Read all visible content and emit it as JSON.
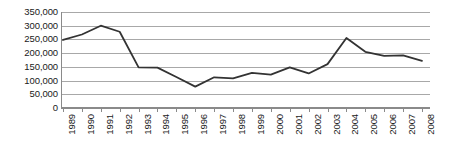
{
  "chart_data": {
    "type": "line",
    "title": "",
    "xlabel": "",
    "ylabel": "",
    "grid": true,
    "legend": false,
    "ylim": [
      0,
      350000
    ],
    "ytick_step": 50000,
    "ytick_labels": [
      "350,000",
      "300,000",
      "250,000",
      "200,000",
      "150,000",
      "100,000",
      "50,000",
      "0"
    ],
    "ytick_values": [
      350000,
      300000,
      250000,
      200000,
      150000,
      100000,
      50000,
      0
    ],
    "categories": [
      "1989",
      "1990",
      "1991",
      "1992",
      "1993",
      "1994",
      "1995",
      "1996",
      "1997",
      "1998",
      "1999",
      "2000",
      "2001",
      "2002",
      "2003",
      "2004",
      "2005",
      "2006",
      "2007",
      "2008"
    ],
    "values": [
      248000,
      268000,
      300000,
      278000,
      148000,
      147000,
      113000,
      78000,
      112000,
      108000,
      128000,
      122000,
      148000,
      126000,
      160000,
      255000,
      205000,
      190000,
      192000,
      172000
    ],
    "series_color": "#333333",
    "grid_color": "#a8a8a8",
    "axis_color": "#8a8a8a"
  }
}
